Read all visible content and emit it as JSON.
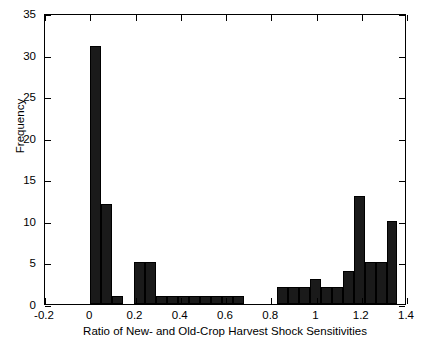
{
  "chart_data": {
    "type": "bar",
    "title": "",
    "xlabel": "Ratio of New- and Old-Crop Harvest Shock Sensitivities",
    "ylabel": "Frequency",
    "xlim": [
      -0.2,
      1.4
    ],
    "ylim": [
      0,
      35
    ],
    "xticks": [
      "-0.2",
      "0",
      "0.2",
      "0.4",
      "0.6",
      "0.8",
      "1",
      "1.2",
      "1.4"
    ],
    "xtick_values": [
      -0.2,
      0,
      0.2,
      0.4,
      0.6,
      0.8,
      1,
      1.2,
      1.4
    ],
    "yticks": [
      "0",
      "5",
      "10",
      "15",
      "20",
      "25",
      "30",
      "35"
    ],
    "ytick_values": [
      0,
      5,
      10,
      15,
      20,
      25,
      30,
      35
    ],
    "grid": false,
    "legend": null,
    "bin_width": 0.0485,
    "bar_color": "#1a1a1a",
    "bins": [
      {
        "left": 0.0,
        "right": 0.0485,
        "value": 31
      },
      {
        "left": 0.0485,
        "right": 0.097,
        "value": 12
      },
      {
        "left": 0.097,
        "right": 0.1455,
        "value": 1
      },
      {
        "left": 0.1455,
        "right": 0.194,
        "value": 0
      },
      {
        "left": 0.194,
        "right": 0.2425,
        "value": 5
      },
      {
        "left": 0.2425,
        "right": 0.291,
        "value": 5
      },
      {
        "left": 0.291,
        "right": 0.3395,
        "value": 1
      },
      {
        "left": 0.3395,
        "right": 0.388,
        "value": 1
      },
      {
        "left": 0.388,
        "right": 0.4365,
        "value": 1
      },
      {
        "left": 0.4365,
        "right": 0.485,
        "value": 1
      },
      {
        "left": 0.485,
        "right": 0.5335,
        "value": 1
      },
      {
        "left": 0.5335,
        "right": 0.582,
        "value": 1
      },
      {
        "left": 0.582,
        "right": 0.6305,
        "value": 1
      },
      {
        "left": 0.6305,
        "right": 0.679,
        "value": 1
      },
      {
        "left": 0.679,
        "right": 0.7275,
        "value": 0
      },
      {
        "left": 0.7275,
        "right": 0.776,
        "value": 0
      },
      {
        "left": 0.776,
        "right": 0.8245,
        "value": 0
      },
      {
        "left": 0.8245,
        "right": 0.873,
        "value": 2
      },
      {
        "left": 0.873,
        "right": 0.9215,
        "value": 2
      },
      {
        "left": 0.9215,
        "right": 0.97,
        "value": 2
      },
      {
        "left": 0.97,
        "right": 1.0185,
        "value": 3
      },
      {
        "left": 1.0185,
        "right": 1.067,
        "value": 2
      },
      {
        "left": 1.067,
        "right": 1.1155,
        "value": 2
      },
      {
        "left": 1.1155,
        "right": 1.164,
        "value": 4
      },
      {
        "left": 1.164,
        "right": 1.2125,
        "value": 13
      },
      {
        "left": 1.2125,
        "right": 1.261,
        "value": 5
      },
      {
        "left": 1.261,
        "right": 1.3095,
        "value": 5
      },
      {
        "left": 1.3095,
        "right": 1.358,
        "value": 10
      }
    ]
  }
}
